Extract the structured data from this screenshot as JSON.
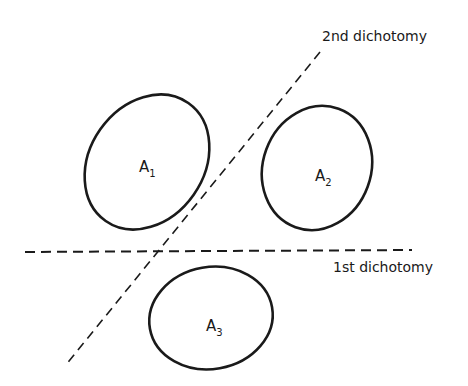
{
  "diagram": {
    "labels": {
      "second_dichotomy": "2nd dichotomy",
      "first_dichotomy": "1st dichotomy"
    },
    "sets": [
      {
        "name": "A",
        "subscript": "1"
      },
      {
        "name": "A",
        "subscript": "2"
      },
      {
        "name": "A",
        "subscript": "3"
      }
    ],
    "colors": {
      "stroke": "#1a1a1a",
      "background": "#ffffff"
    }
  }
}
